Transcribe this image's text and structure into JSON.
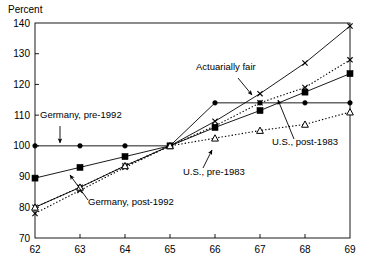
{
  "chart_data": {
    "type": "line",
    "title": "",
    "ylabel": "Percent",
    "xlabel": "",
    "xlim": [
      62,
      69
    ],
    "ylim": [
      70,
      140
    ],
    "ytick_labels": [
      "140",
      "130",
      "120",
      "110",
      "100",
      "90",
      "80",
      "70"
    ],
    "yticks": [
      140,
      130,
      120,
      110,
      100,
      90,
      80,
      70
    ],
    "xtick_labels": [
      "62",
      "63",
      "64",
      "65",
      "66",
      "67",
      "68",
      "69"
    ],
    "xticks": [
      62,
      63,
      64,
      65,
      66,
      67,
      68,
      69
    ],
    "grid": false,
    "legend": "annotations-inline",
    "x": [
      62,
      63,
      64,
      65,
      66,
      67,
      68,
      69
    ],
    "series": [
      {
        "name": "Actuarially fair",
        "marker": "x",
        "line": "solid",
        "values": [
          80,
          86.5,
          93.5,
          100,
          108,
          117,
          127,
          139
        ]
      },
      {
        "name": "Germany, pre-1992",
        "marker": "circle",
        "line": "solid",
        "values": [
          100,
          100,
          100,
          100,
          114,
          114,
          114,
          114
        ]
      },
      {
        "name": "Germany, post-1992",
        "marker": "x",
        "line": "dotted",
        "values": [
          78,
          85.5,
          93,
          100,
          106.5,
          114,
          119,
          128
        ]
      },
      {
        "name": "U.S., pre-1983",
        "marker": "square",
        "line": "solid",
        "values": [
          89.5,
          93,
          96.5,
          100,
          106,
          111.5,
          117.5,
          123.5
        ]
      },
      {
        "name": "U.S., post-1983",
        "marker": "triangle",
        "line": "dotted",
        "values": [
          80,
          86.5,
          93.5,
          100,
          102.5,
          105,
          107,
          111
        ]
      }
    ],
    "annotations": [
      {
        "text": "Actuarially fair",
        "label_x": 196,
        "label_y": 70,
        "arrow": [
          238,
          78,
          252,
          95
        ]
      },
      {
        "text": "Germany, pre-1992",
        "label_x": 40,
        "label_y": 118,
        "arrow": [
          60,
          126,
          60,
          143
        ]
      },
      {
        "text": "Germany, post-1992",
        "label_x": 88,
        "label_y": 205,
        "arrow": [
          88,
          200,
          70,
          175
        ]
      },
      {
        "text": "U.S., pre-1983",
        "label_x": 183,
        "label_y": 175,
        "arrow": [
          203,
          168,
          212,
          150
        ]
      },
      {
        "text": "U.S., post-1983",
        "label_x": 272,
        "label_y": 145,
        "arrow": [
          294,
          139,
          278,
          100
        ]
      }
    ]
  }
}
